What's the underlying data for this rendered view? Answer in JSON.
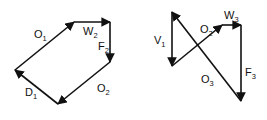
{
  "diagrams": [
    {
      "name": "left-vector-polygon",
      "vectors": [
        {
          "id": "O1",
          "base": "O",
          "sub": "1",
          "from": [
            15,
            70
          ],
          "to": [
            74,
            22
          ],
          "label_pos": [
            34,
            38
          ]
        },
        {
          "id": "W2",
          "base": "W",
          "sub": "2",
          "from": [
            74,
            22
          ],
          "to": [
            110,
            22
          ],
          "label_pos": [
            83,
            35
          ]
        },
        {
          "id": "F2",
          "base": "F",
          "sub": "2",
          "from": [
            110,
            22
          ],
          "to": [
            110,
            62
          ],
          "label_pos": [
            98,
            50
          ]
        },
        {
          "id": "O2",
          "base": "O",
          "sub": "2",
          "from": [
            110,
            62
          ],
          "to": [
            58,
            104
          ],
          "label_pos": [
            97,
            92
          ]
        },
        {
          "id": "D1",
          "base": "D",
          "sub": "1",
          "from": [
            58,
            104
          ],
          "to": [
            15,
            70
          ],
          "label_pos": [
            25,
            96
          ]
        }
      ]
    },
    {
      "name": "right-vector-polygon",
      "vectors": [
        {
          "id": "V1",
          "base": "V",
          "sub": "1",
          "from": [
            172,
            12
          ],
          "to": [
            172,
            66
          ],
          "label_pos": [
            154,
            44
          ]
        },
        {
          "id": "O2",
          "base": "O",
          "sub": "2",
          "from": [
            172,
            66
          ],
          "to": [
            222,
            25
          ],
          "label_pos": [
            200,
            33
          ]
        },
        {
          "id": "W3",
          "base": "W",
          "sub": "3",
          "from": [
            222,
            25
          ],
          "to": [
            241,
            25
          ],
          "label_pos": [
            224,
            19
          ]
        },
        {
          "id": "F3",
          "base": "F",
          "sub": "3",
          "from": [
            241,
            25
          ],
          "to": [
            241,
            101
          ],
          "label_pos": [
            245,
            76
          ]
        },
        {
          "id": "O3",
          "base": "O",
          "sub": "3",
          "from": [
            241,
            101
          ],
          "to": [
            172,
            12
          ],
          "label_pos": [
            201,
            83
          ]
        }
      ]
    }
  ],
  "colors": {
    "stroke": "#111111",
    "background": "#ffffff"
  }
}
